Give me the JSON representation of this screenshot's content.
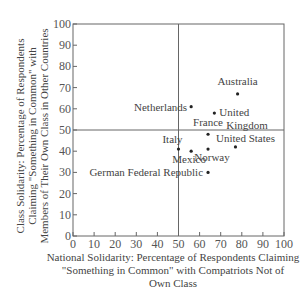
{
  "chart_data": {
    "type": "scatter",
    "title": "",
    "xlabel": "National Solidarity: Percentage of Respondents Claiming \"Something in Common\" with Compatriots Not of Own Class",
    "xlabel_lines": [
      "National Solidarity: Percentage of Respondents Claiming",
      "\"Something in Common\" with Compatriots Not of",
      "Own Class"
    ],
    "ylabel": "Class Solidarity: Percentage of Respondents Claiming \"Something in Common\" with Members of Their Own Class in Other Countries",
    "ylabel_lines": [
      "Class Solidarity: Percentage of Respondents",
      "Claiming \"Something in Common\" with",
      "Members of Their Own Class in Other Countries"
    ],
    "xlim": [
      0,
      100
    ],
    "ylim": [
      0,
      100
    ],
    "xticks": [
      0,
      10,
      20,
      30,
      40,
      50,
      60,
      70,
      80,
      90,
      100
    ],
    "yticks": [
      0,
      10,
      20,
      30,
      40,
      50,
      60,
      70,
      80,
      90,
      100
    ],
    "reference_lines": {
      "x": 50,
      "y": 50
    },
    "grid": false,
    "points": [
      {
        "label": "Australia",
        "x": 78,
        "y": 67
      },
      {
        "label": "Netherlands",
        "x": 56,
        "y": 61
      },
      {
        "label": "United Kingdom",
        "x": 67,
        "y": 58
      },
      {
        "label": "France",
        "x": 64,
        "y": 48
      },
      {
        "label": "United States",
        "x": 77,
        "y": 42
      },
      {
        "label": "Italy",
        "x": 50,
        "y": 41
      },
      {
        "label": "Norway",
        "x": 64,
        "y": 41
      },
      {
        "label": "Mexico",
        "x": 56,
        "y": 40
      },
      {
        "label": "German Federal Republic",
        "x": 64,
        "y": 30
      }
    ]
  }
}
